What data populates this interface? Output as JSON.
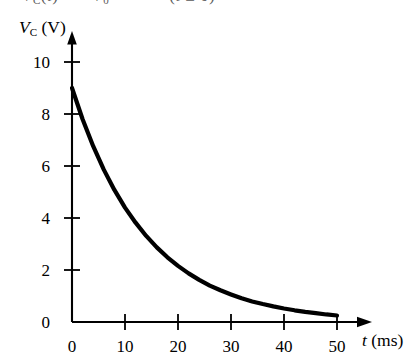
{
  "page": {
    "background_color": "#ffffff",
    "ink_color": "#000000",
    "cutoff_text_top": {
      "visible_fragment": "C (t)  =  V₀  e⁻ᵗᐟᴿᶜ   ( t  ≥  0 )",
      "note_rendered": "partially clipped line of equation above the figure"
    }
  },
  "chart_data": {
    "type": "line",
    "title": "",
    "subtitle": "",
    "xlabel": "t (ms)",
    "ylabel": "V_C (V)",
    "xlabel_symbol": "t",
    "xlabel_unit": "(ms)",
    "ylabel_symbol": "V",
    "ylabel_subscript": "C",
    "ylabel_unit": "(V)",
    "xlim": [
      0,
      52
    ],
    "ylim": [
      0,
      10.8
    ],
    "xticks": [
      0,
      10,
      20,
      30,
      40,
      50
    ],
    "xtick_labels": [
      "0",
      "10",
      "20",
      "30",
      "40",
      "50"
    ],
    "yticks": [
      0,
      2,
      4,
      6,
      8,
      10
    ],
    "ytick_labels": [
      "0",
      "2",
      "4",
      "6",
      "8",
      "10"
    ],
    "grid": false,
    "legend": null,
    "axis_arrows": true,
    "curve_color": "#000000",
    "curve_width_px": 4.2,
    "series": [
      {
        "name": "capacitor discharge",
        "equation": "V_C = 9 e^(-t/14)",
        "initial_value": 9.0,
        "time_constant_ms": 14.0,
        "x": [
          0,
          2,
          4,
          6,
          8,
          10,
          12,
          14,
          16,
          18,
          20,
          22,
          24,
          26,
          28,
          30,
          32,
          34,
          36,
          38,
          40,
          42,
          44,
          46,
          48,
          50
        ],
        "values": [
          9.0,
          7.8,
          6.76,
          5.86,
          5.08,
          4.4,
          3.82,
          3.31,
          2.87,
          2.49,
          2.16,
          1.87,
          1.62,
          1.4,
          1.22,
          1.06,
          0.91,
          0.79,
          0.69,
          0.6,
          0.52,
          0.45,
          0.39,
          0.34,
          0.29,
          0.25
        ]
      }
    ],
    "annotations": []
  },
  "geometry": {
    "origin_x_px": 72,
    "origin_y_px": 322,
    "x_per_ms_px": 5.3,
    "y_per_volt_px": 26.0,
    "x_axis_arrow_tip_px": 371,
    "y_axis_arrow_tip_px": 33
  }
}
